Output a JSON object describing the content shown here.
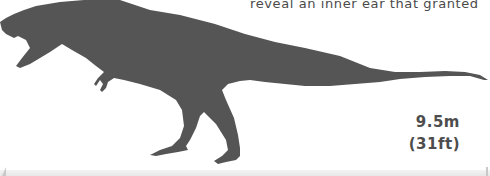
{
  "caption": {
    "text": "reveal an inner ear that granted"
  },
  "dinosaur": {
    "icon": "t-rex-silhouette-icon",
    "color": "#555555"
  },
  "size": {
    "metric": "9.5m",
    "imperial": "(31ft)"
  },
  "colors": {
    "background": "#ffffff",
    "text": "#4d4d4d",
    "silhouette": "#555555"
  }
}
